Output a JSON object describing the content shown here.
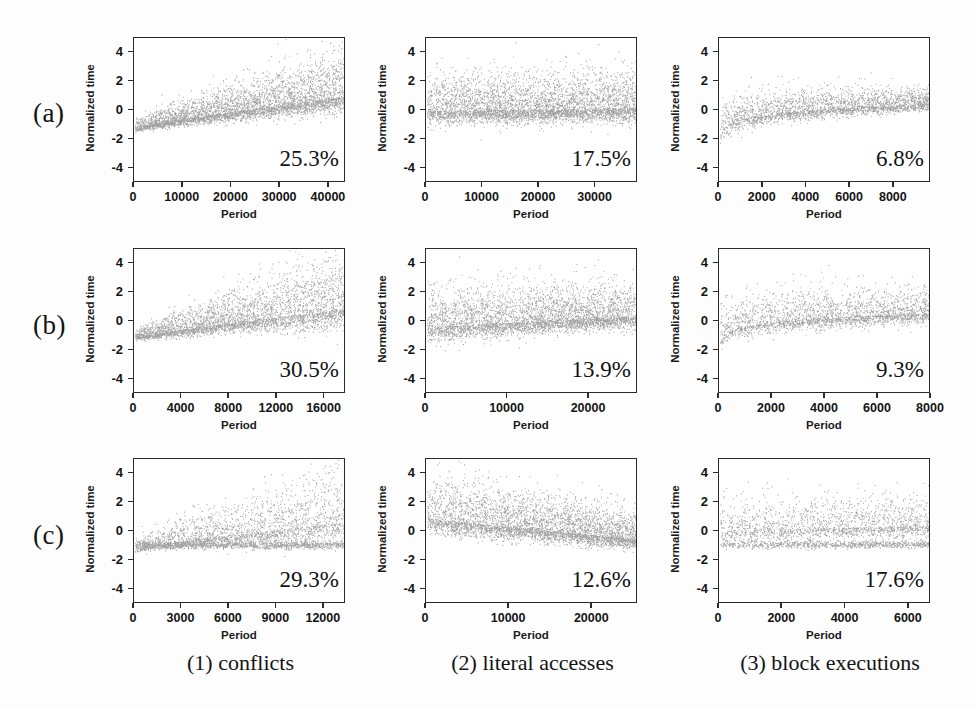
{
  "figure": {
    "row_labels": [
      "(a)",
      "(b)",
      "(c)"
    ],
    "column_captions": [
      "(1) conflicts",
      "(2) literal accesses",
      "(3) block executions"
    ],
    "axis_label_x": "Period",
    "axis_label_y": "Normalized time",
    "point_color": "#8f8f8f",
    "frame_color": "#2a2a2a",
    "background_color": "#fdfdfd"
  },
  "chart_data": [
    {
      "type": "scatter",
      "panel": "a1",
      "row": "(a)",
      "column": "(1) conflicts",
      "title": "",
      "xlabel": "Period",
      "ylabel": "Normalized time",
      "xlim": [
        0,
        43500
      ],
      "ylim": [
        -5,
        5
      ],
      "xticks": [
        0,
        10000,
        20000,
        30000,
        40000
      ],
      "xtick_labels": [
        "0",
        "10000",
        "20000",
        "30000",
        "40000"
      ],
      "yticks": [
        -4,
        -2,
        0,
        2,
        4
      ],
      "ytick_labels": [
        "-4",
        "-2",
        "0",
        "2",
        "4"
      ],
      "grid": false,
      "annotation": "25.3%",
      "n_points": 4200,
      "trend": "rising",
      "trend_start": -1.25,
      "trend_end": 0.95,
      "spread_start": 0.18,
      "spread_end": 0.85,
      "skew": 0.75
    },
    {
      "type": "scatter",
      "panel": "a2",
      "row": "(a)",
      "column": "(2) literal accesses",
      "title": "",
      "xlabel": "Period",
      "ylabel": "Normalized time",
      "xlim": [
        0,
        37500
      ],
      "ylim": [
        -5,
        5
      ],
      "xticks": [
        0,
        10000,
        20000,
        30000
      ],
      "xtick_labels": [
        "0",
        "10000",
        "20000",
        "30000"
      ],
      "yticks": [
        -4,
        -2,
        0,
        2,
        4
      ],
      "ytick_labels": [
        "-4",
        "-2",
        "0",
        "2",
        "4"
      ],
      "grid": false,
      "annotation": "17.5%",
      "n_points": 4400,
      "trend": "flat",
      "trend_start": -0.05,
      "trend_end": 0.12,
      "spread_start": 0.72,
      "spread_end": 0.72,
      "skew": 0.62
    },
    {
      "type": "scatter",
      "panel": "a3",
      "row": "(a)",
      "column": "(3) block executions",
      "title": "",
      "xlabel": "Period",
      "ylabel": "Normalized time",
      "xlim": [
        0,
        9700
      ],
      "ylim": [
        -5,
        5
      ],
      "xticks": [
        0,
        2000,
        4000,
        6000,
        8000
      ],
      "xtick_labels": [
        "0",
        "2000",
        "4000",
        "6000",
        "8000"
      ],
      "yticks": [
        -4,
        -2,
        0,
        2,
        4
      ],
      "ytick_labels": [
        "-4",
        "-2",
        "0",
        "2",
        "4"
      ],
      "grid": false,
      "annotation": "6.8%",
      "n_points": 2600,
      "trend": "rising-log",
      "trend_start": -2.2,
      "trend_end": 0.45,
      "spread_start": 0.55,
      "spread_end": 0.35,
      "skew": 0.5
    },
    {
      "type": "scatter",
      "panel": "b1",
      "row": "(b)",
      "column": "(1) conflicts",
      "title": "",
      "xlabel": "Period",
      "ylabel": "Normalized time",
      "xlim": [
        0,
        17800
      ],
      "ylim": [
        -5,
        5
      ],
      "xticks": [
        0,
        4000,
        8000,
        12000,
        16000
      ],
      "xtick_labels": [
        "0",
        "4000",
        "8000",
        "12000",
        "16000"
      ],
      "yticks": [
        -4,
        -2,
        0,
        2,
        4
      ],
      "ytick_labels": [
        "-4",
        "-2",
        "0",
        "2",
        "4"
      ],
      "grid": false,
      "annotation": "30.5%",
      "n_points": 3600,
      "trend": "rising",
      "trend_start": -1.15,
      "trend_end": 0.85,
      "spread_start": 0.15,
      "spread_end": 1.05,
      "skew": 0.8
    },
    {
      "type": "scatter",
      "panel": "b2",
      "row": "(b)",
      "column": "(2) literal accesses",
      "title": "",
      "xlabel": "Period",
      "ylabel": "Normalized time",
      "xlim": [
        0,
        26000
      ],
      "ylim": [
        -5,
        5
      ],
      "xticks": [
        0,
        10000,
        20000
      ],
      "xtick_labels": [
        "0",
        "10000",
        "20000"
      ],
      "yticks": [
        -4,
        -2,
        0,
        2,
        4
      ],
      "ytick_labels": [
        "-4",
        "-2",
        "0",
        "2",
        "4"
      ],
      "grid": false,
      "annotation": "13.9%",
      "n_points": 4000,
      "trend": "slight-rise",
      "trend_start": -0.45,
      "trend_end": 0.32,
      "spread_start": 0.75,
      "spread_end": 0.62,
      "skew": 0.7
    },
    {
      "type": "scatter",
      "panel": "b3",
      "row": "(b)",
      "column": "(3) block executions",
      "title": "",
      "xlabel": "Period",
      "ylabel": "Normalized time",
      "xlim": [
        0,
        8000
      ],
      "ylim": [
        -5,
        5
      ],
      "xticks": [
        0,
        2000,
        4000,
        6000,
        8000
      ],
      "xtick_labels": [
        "0",
        "2000",
        "4000",
        "6000",
        "8000"
      ],
      "yticks": [
        -4,
        -2,
        0,
        2,
        4
      ],
      "ytick_labels": [
        "-4",
        "-2",
        "0",
        "2",
        "4"
      ],
      "grid": false,
      "annotation": "9.3%",
      "n_points": 2400,
      "trend": "rising-log",
      "trend_start": -1.8,
      "trend_end": 0.55,
      "spread_start": 0.6,
      "spread_end": 0.52,
      "skew": 0.6
    },
    {
      "type": "scatter",
      "panel": "c1",
      "row": "(c)",
      "column": "(1) conflicts",
      "title": "",
      "xlabel": "Period",
      "ylabel": "Normalized time",
      "xlim": [
        0,
        13400
      ],
      "ylim": [
        -5,
        5
      ],
      "xticks": [
        0,
        3000,
        6000,
        9000,
        12000
      ],
      "xtick_labels": [
        "0",
        "3000",
        "6000",
        "9000",
        "12000"
      ],
      "yticks": [
        -4,
        -2,
        0,
        2,
        4
      ],
      "ytick_labels": [
        "-4",
        "-2",
        "0",
        "2",
        "4"
      ],
      "grid": false,
      "annotation": "29.3%",
      "n_points": 3400,
      "trend": "bimodal-rise",
      "trend_start": -1.2,
      "trend_end": 0.6,
      "spread_start": 0.2,
      "spread_end": 1.0,
      "skew": 0.85,
      "band_level": -0.95
    },
    {
      "type": "scatter",
      "panel": "c2",
      "row": "(c)",
      "column": "(2) literal accesses",
      "title": "",
      "xlabel": "Period",
      "ylabel": "Normalized time",
      "xlim": [
        0,
        25500
      ],
      "ylim": [
        -5,
        5
      ],
      "xticks": [
        0,
        10000,
        20000
      ],
      "xtick_labels": [
        "0",
        "10000",
        "20000"
      ],
      "yticks": [
        -4,
        -2,
        0,
        2,
        4
      ],
      "ytick_labels": [
        "-4",
        "-2",
        "0",
        "2",
        "4"
      ],
      "grid": false,
      "annotation": "12.6%",
      "n_points": 4200,
      "trend": "declining",
      "trend_start": 0.85,
      "trend_end": -0.55,
      "spread_start": 0.8,
      "spread_end": 0.5,
      "skew": 0.75
    },
    {
      "type": "scatter",
      "panel": "c3",
      "row": "(c)",
      "column": "(3) block executions",
      "title": "",
      "xlabel": "Period",
      "ylabel": "Normalized time",
      "xlim": [
        0,
        6700
      ],
      "ylim": [
        -5,
        5
      ],
      "xticks": [
        0,
        2000,
        4000,
        6000
      ],
      "xtick_labels": [
        "0",
        "2000",
        "4000",
        "6000"
      ],
      "yticks": [
        -4,
        -2,
        0,
        2,
        4
      ],
      "ytick_labels": [
        "-4",
        "-2",
        "0",
        "2",
        "4"
      ],
      "grid": false,
      "annotation": "17.6%",
      "n_points": 2600,
      "trend": "bimodal-flat",
      "trend_start": 0.05,
      "trend_end": 0.35,
      "spread_start": 0.6,
      "spread_end": 0.6,
      "skew": 0.7,
      "band_level": -0.9
    }
  ]
}
